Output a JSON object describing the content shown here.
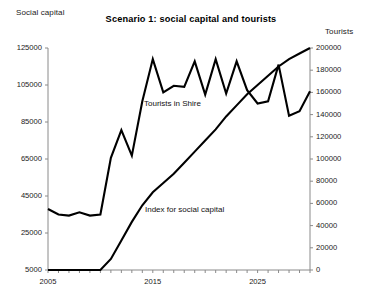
{
  "chart_data": {
    "type": "line",
    "title": "Scenario 1: social capital and tourists",
    "xlabel": "",
    "ylabel": "Social capital",
    "y2label": "Tourists",
    "grid": false,
    "legend_position": "inline-annotations",
    "x": [
      2005,
      2006,
      2007,
      2008,
      2009,
      2010,
      2011,
      2012,
      2013,
      2014,
      2015,
      2016,
      2017,
      2018,
      2019,
      2020,
      2021,
      2022,
      2023,
      2024,
      2025,
      2026,
      2027,
      2028,
      2029,
      2030
    ],
    "xlim": [
      2005,
      2030
    ],
    "xticks": [
      2005,
      2015,
      2025
    ],
    "xtick_labels": [
      "2005",
      "2015",
      "2025"
    ],
    "ylim": [
      5000,
      125000
    ],
    "yticks": [
      5000,
      25000,
      45000,
      65000,
      85000,
      105000,
      125000
    ],
    "ytick_labels": [
      "5000",
      "25000",
      "45000",
      "65000",
      "85000",
      "105000",
      "125000"
    ],
    "y2lim": [
      0,
      200000
    ],
    "y2ticks": [
      0,
      20000,
      40000,
      60000,
      80000,
      100000,
      120000,
      140000,
      160000,
      180000,
      200000
    ],
    "y2tick_labels": [
      "0",
      "20000",
      "40000",
      "60000",
      "80000",
      "100000",
      "120000",
      "140000",
      "160000",
      "180000",
      "200000"
    ],
    "series": [
      {
        "name": "Tourists in Shire",
        "axis": "right",
        "color": "#000000",
        "values": [
          55000,
          50000,
          49000,
          52000,
          49000,
          50000,
          101000,
          126000,
          103000,
          152000,
          190000,
          160000,
          166000,
          165000,
          188000,
          158000,
          190000,
          159000,
          188000,
          162000,
          150000,
          152000,
          185000,
          139000,
          143000,
          161000
        ]
      },
      {
        "name": "Index for social capital",
        "axis": "left",
        "color": "#000000",
        "values": [
          5000,
          5000,
          5000,
          5000,
          5000,
          5000,
          11000,
          21000,
          31000,
          40000,
          47000,
          52000,
          57000,
          63000,
          69000,
          75000,
          81000,
          88000,
          94000,
          100000,
          105000,
          110000,
          115000,
          119000,
          122000,
          125000
        ]
      }
    ],
    "annotations": [
      {
        "text": "Tourists in Shire"
      },
      {
        "text": "Index for social capital"
      }
    ]
  }
}
